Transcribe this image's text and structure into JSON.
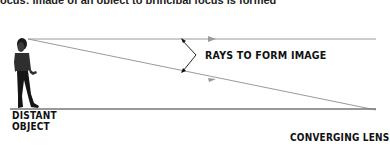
{
  "caption": {
    "text": "ocus: image of an object to principal focus is formed"
  },
  "diagram": {
    "rays_label": "RAYS TO FORM IMAGE",
    "object_label_line1": "DISTANT",
    "object_label_line2": "OBJECT",
    "lens_label": "CONVERGING LENS",
    "colors": {
      "ray": "#9a9a9a",
      "baseline": "#777777",
      "text": "#111111",
      "figure": "#1a1a1a"
    }
  }
}
